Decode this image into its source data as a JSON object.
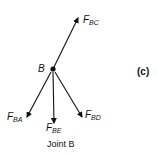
{
  "diagram": {
    "type": "free-body-diagram",
    "joint": {
      "label": "B",
      "x": 53,
      "y": 69
    },
    "forces": [
      {
        "id": "F_BC",
        "main": "F",
        "sub": "BC",
        "tip": [
          78,
          18
        ],
        "label_pos": [
          83,
          19
        ]
      },
      {
        "id": "F_BA",
        "main": "F",
        "sub": "BA",
        "tip": [
          27,
          117
        ],
        "label_pos": [
          7,
          114
        ]
      },
      {
        "id": "F_BE",
        "main": "F",
        "sub": "BE",
        "tip": [
          54,
          123
        ],
        "label_pos": [
          46,
          124
        ]
      },
      {
        "id": "F_BD",
        "main": "F",
        "sub": "BD",
        "tip": [
          82,
          117
        ],
        "label_pos": [
          85,
          111
        ]
      }
    ],
    "panel_label": "(c)",
    "caption": "Joint B",
    "colors": {
      "ink": "#111111",
      "background": "#ffffff"
    }
  }
}
